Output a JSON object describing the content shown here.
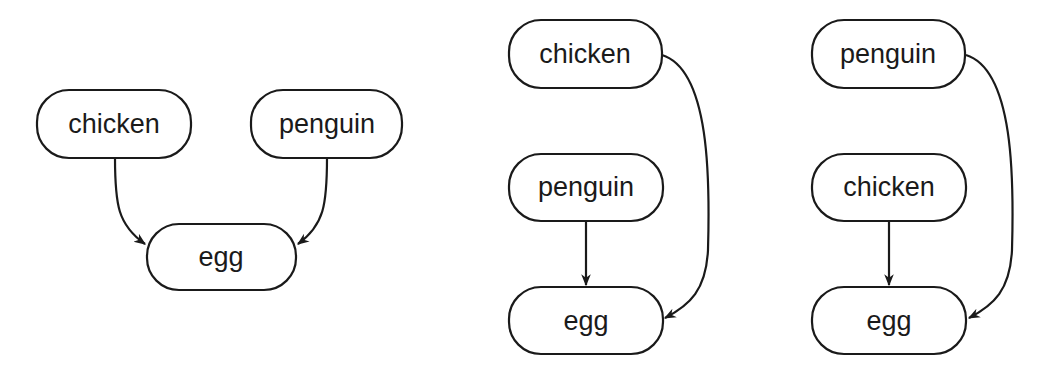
{
  "diagrams": [
    {
      "id": "left",
      "nodes": [
        {
          "label": "chicken"
        },
        {
          "label": "penguin"
        },
        {
          "label": "egg"
        }
      ],
      "edges": [
        {
          "from": "chicken",
          "to": "egg"
        },
        {
          "from": "penguin",
          "to": "egg"
        }
      ]
    },
    {
      "id": "middle",
      "nodes": [
        {
          "label": "chicken"
        },
        {
          "label": "penguin"
        },
        {
          "label": "egg"
        }
      ],
      "edges": [
        {
          "from": "chicken",
          "to": "egg"
        },
        {
          "from": "penguin",
          "to": "egg"
        }
      ]
    },
    {
      "id": "right",
      "nodes": [
        {
          "label": "penguin"
        },
        {
          "label": "chicken"
        },
        {
          "label": "egg"
        }
      ],
      "edges": [
        {
          "from": "penguin",
          "to": "egg"
        },
        {
          "from": "chicken",
          "to": "egg"
        }
      ]
    }
  ],
  "colors": {
    "stroke": "#1a1a1a",
    "background": "#ffffff"
  }
}
